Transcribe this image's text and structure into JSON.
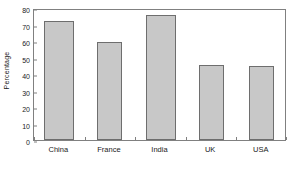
{
  "chart_data": {
    "type": "bar",
    "title": "",
    "xlabel": "",
    "ylabel": "Percentage",
    "categories": [
      "China",
      "France",
      "India",
      "UK",
      "USA"
    ],
    "values": [
      72,
      59.5,
      76,
      45.3,
      44.8
    ],
    "ylim": [
      0,
      80
    ],
    "ytick_labels": [
      "0",
      "10",
      "20",
      "30",
      "40",
      "50",
      "60",
      "70",
      "80"
    ],
    "ytick_values": [
      0,
      10,
      20,
      30,
      40,
      50,
      60,
      70,
      80
    ],
    "grid": false,
    "legend": false,
    "legend_position": "none",
    "bar_fill_color": "#c8c8c8",
    "bar_edge_color": "#6e6e6e",
    "axis_color": "#808080",
    "background_color": "#ffffff"
  }
}
